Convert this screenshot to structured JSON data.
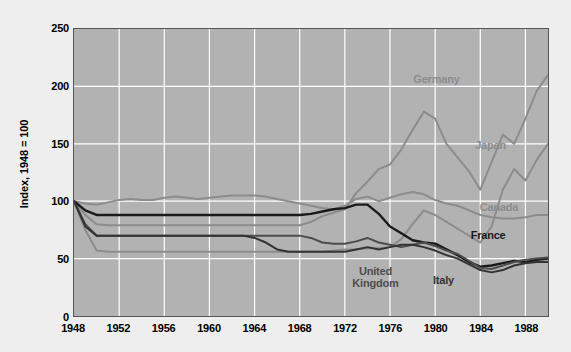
{
  "chart_data": {
    "type": "line",
    "title": "",
    "subtitle": "",
    "xlabel": "",
    "ylabel": "Index, 1948 = 100",
    "xlim": [
      1948,
      1990
    ],
    "ylim": [
      0,
      250
    ],
    "yticks": [
      0,
      50,
      100,
      150,
      200,
      250
    ],
    "xticks": [
      1948,
      1952,
      1956,
      1960,
      1964,
      1968,
      1972,
      1976,
      1980,
      1984,
      1988
    ],
    "grid": true,
    "legend_position": "inline-labels",
    "plot_background": "#b2b2b2",
    "gridline_color": "#ffffff",
    "figure_background": "#eeeeee",
    "x": [
      1948,
      1949,
      1950,
      1951,
      1952,
      1953,
      1954,
      1955,
      1956,
      1957,
      1958,
      1959,
      1960,
      1961,
      1962,
      1963,
      1964,
      1965,
      1966,
      1967,
      1968,
      1969,
      1970,
      1971,
      1972,
      1973,
      1974,
      1975,
      1976,
      1977,
      1978,
      1979,
      1980,
      1981,
      1982,
      1983,
      1984,
      1985,
      1986,
      1987,
      1988,
      1989,
      1990
    ],
    "series": [
      {
        "name": "Germany",
        "color": "#8c8c8c",
        "width": 2.0,
        "label": "Germany",
        "label_x": 1982.2,
        "label_y": 207,
        "label_align": "end",
        "values": [
          100,
          88,
          80,
          79,
          79,
          79,
          79,
          79,
          79,
          79,
          79,
          79,
          79,
          79,
          79,
          79,
          79,
          79,
          79,
          79,
          79,
          82,
          87,
          90,
          93,
          107,
          117,
          128,
          132,
          145,
          162,
          178,
          172,
          150,
          138,
          126,
          110,
          134,
          158,
          150,
          172,
          196,
          210
        ]
      },
      {
        "name": "Japan",
        "color": "#8c8c8c",
        "width": 2.0,
        "label": "Japan",
        "label_x": 1983.4,
        "label_y": 150,
        "label_align": "start",
        "values": [
          100,
          75,
          57,
          56,
          56,
          56,
          56,
          56,
          56,
          56,
          56,
          56,
          56,
          56,
          56,
          56,
          56,
          56,
          56,
          56,
          56,
          56,
          56,
          57,
          58,
          58,
          59,
          59,
          60,
          67,
          80,
          92,
          88,
          82,
          76,
          70,
          64,
          78,
          110,
          128,
          118,
          136,
          150
        ]
      },
      {
        "name": "Canada",
        "color": "#8c8c8c",
        "width": 2.0,
        "label": "Canada",
        "label_x": 1983.8,
        "label_y": 96,
        "label_align": "start",
        "values": [
          100,
          98,
          97,
          99,
          101,
          102,
          101,
          101,
          103,
          104,
          103,
          102,
          103,
          104,
          105,
          105,
          105,
          104,
          102,
          100,
          98,
          96,
          94,
          93,
          96,
          102,
          104,
          100,
          103,
          106,
          108,
          106,
          101,
          98,
          96,
          92,
          88,
          86,
          85,
          85,
          86,
          88,
          88
        ]
      },
      {
        "name": "France",
        "color": "#1a1a1a",
        "width": 2.4,
        "label": "France",
        "label_x": 1983.0,
        "label_y": 72,
        "label_align": "start",
        "values": [
          100,
          92,
          88,
          88,
          88,
          88,
          88,
          88,
          88,
          88,
          88,
          88,
          88,
          88,
          88,
          88,
          88,
          88,
          88,
          88,
          88,
          89,
          91,
          93,
          94,
          97,
          97,
          89,
          78,
          72,
          66,
          64,
          63,
          58,
          53,
          47,
          43,
          44,
          46,
          48,
          47,
          49,
          50
        ]
      },
      {
        "name": "United Kingdom",
        "color": "#4d4d4d",
        "width": 2.0,
        "label": "United\nKingdom",
        "label_x": 1974.6,
        "label_y": 41,
        "label_align": "middle",
        "values": [
          100,
          80,
          70,
          70,
          70,
          70,
          70,
          70,
          70,
          70,
          70,
          70,
          70,
          70,
          70,
          70,
          70,
          70,
          70,
          70,
          70,
          68,
          64,
          63,
          63,
          65,
          68,
          64,
          62,
          60,
          62,
          64,
          61,
          57,
          54,
          48,
          42,
          41,
          44,
          47,
          49,
          50,
          51
        ]
      },
      {
        "name": "Italy",
        "color": "#333333",
        "width": 2.0,
        "label": "Italy",
        "label_x": 1980.6,
        "label_y": 33,
        "label_align": "middle",
        "values": [
          100,
          78,
          70,
          70,
          70,
          70,
          70,
          70,
          70,
          70,
          70,
          70,
          70,
          70,
          70,
          70,
          68,
          64,
          58,
          56,
          56,
          56,
          56,
          56,
          56,
          58,
          60,
          58,
          60,
          62,
          62,
          60,
          57,
          53,
          50,
          45,
          40,
          38,
          40,
          44,
          46,
          47,
          47
        ]
      }
    ]
  }
}
